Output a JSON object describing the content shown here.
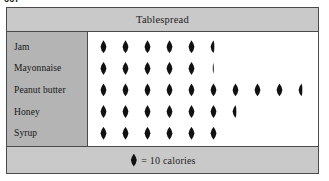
{
  "page_number": "667",
  "figure": {
    "title": "Tablespread",
    "legend": {
      "symbol_name": "droplet-symbol",
      "text": "= 10 calories"
    }
  },
  "chart_data": {
    "type": "bar",
    "chart_subtype": "pictograph",
    "title": "Tablespread",
    "xlabel": "",
    "ylabel": "",
    "unit_label": "= 10 calories",
    "unit_value": 10,
    "grid": false,
    "legend_position": "bottom",
    "categories": [
      "Jam",
      "Mayonnaise",
      "Peanut butter",
      "Honey",
      "Syrup"
    ],
    "values": [
      55,
      51,
      95,
      65,
      60
    ],
    "symbols": [
      {
        "category": "Jam",
        "full": 5,
        "partial": 0.5,
        "total_symbols": 5.5,
        "calories": 55
      },
      {
        "category": "Mayonnaise",
        "full": 5,
        "partial": 0.1,
        "total_symbols": 5.1,
        "calories": 51
      },
      {
        "category": "Peanut butter",
        "full": 9,
        "partial": 0.5,
        "total_symbols": 9.5,
        "calories": 95
      },
      {
        "category": "Honey",
        "full": 6,
        "partial": 0.5,
        "total_symbols": 6.5,
        "calories": 65
      },
      {
        "category": "Syrup",
        "full": 6,
        "partial": 0,
        "total_symbols": 6,
        "calories": 60
      }
    ]
  },
  "colors": {
    "border": "#4a4a4a",
    "band_background": "#c9c9c9",
    "label_column_background": "#b4b4b4",
    "plot_background": "#ffffff",
    "symbol": "#111111",
    "text": "#1d1d1d"
  }
}
